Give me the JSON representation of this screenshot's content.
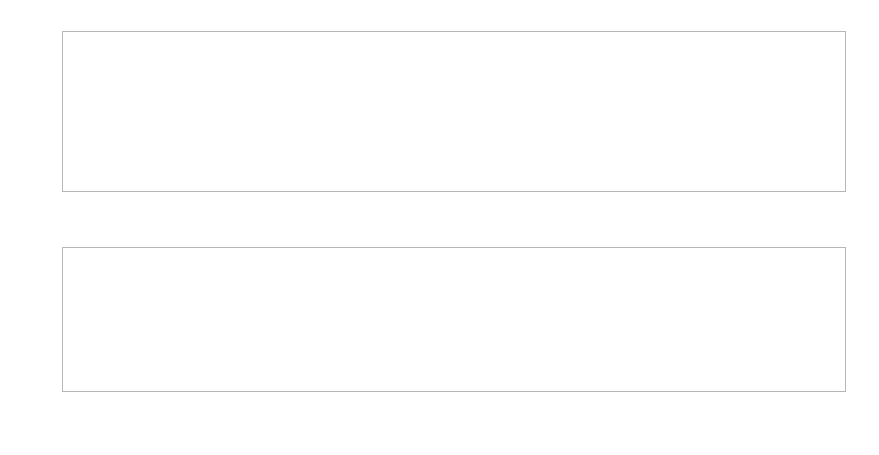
{
  "figure": {
    "width": 879,
    "height": 455,
    "background": "#ffffff",
    "line_color": "#808080",
    "axis_color": "#b6b6b6",
    "tick_color": "#3c3c3c",
    "marker_color": "#1a1a1a"
  },
  "chart_data": [
    {
      "type": "line",
      "id": "top-panel",
      "title": "",
      "xlabel": "",
      "ylabel": "",
      "grid": false,
      "legend": "none",
      "ylim": [
        172.6,
        203.0
      ],
      "yticks": [
        175,
        180,
        185,
        190,
        195,
        200
      ],
      "ytick_labels": [
        "175",
        "180",
        "185",
        "190",
        "195",
        "200"
      ],
      "categories": [
        "1A",
        "2G",
        "3C",
        "4C",
        "5A",
        "6G",
        "7G",
        "8G",
        "9C",
        "10T",
        "11C",
        "12A",
        "13A",
        "14G",
        "15T",
        "16A",
        "17C",
        "18A",
        "19A"
      ],
      "values": [
        201.6,
        201.6,
        201.6,
        199.8,
        199.8,
        199.8,
        199.8,
        198.0,
        198.0,
        198.0,
        197.3,
        197.3,
        181.3,
        179.0,
        175.7,
        174.8,
        174.7,
        173.8,
        173.6
      ],
      "vertical_markers": [
        "1A",
        "19A"
      ],
      "marker_points": [
        "1A",
        "19A"
      ]
    },
    {
      "type": "line",
      "id": "bottom-panel",
      "title": "",
      "xlabel": "",
      "ylabel": "",
      "grid": false,
      "legend": "none",
      "ylim": [
        991.5,
        1013.2
      ],
      "yticks": [
        995,
        1000,
        1005,
        1010
      ],
      "ytick_labels": [
        "995",
        "1000",
        "1005",
        "1010"
      ],
      "categories": [
        "516G",
        "517C",
        "518T",
        "519G",
        "520G",
        "521A",
        "522G",
        "523A",
        "524T",
        "525G",
        "526A",
        "527T",
        "528C",
        "529C",
        "530T",
        "531C",
        "532A",
        "533A",
        "534C",
        "535A",
        "536A",
        "537G",
        "538C",
        "539C",
        "540A",
        "541G",
        "542G",
        "543G",
        "544C",
        "545T",
        "546C",
        "547A",
        "548A",
        "549G",
        "550T",
        "551A",
        "552C",
        "553A",
        "554A",
        "555G",
        "556C",
        "557C",
        "558T",
        "559G",
        "560T",
        "561C",
        "562T",
        "563G",
        "564C",
        "565A",
        "566A",
        "567C",
        "568C",
        "569A",
        "570G",
        "571G",
        "572T",
        "573G",
        "574G"
      ],
      "values": [
        1012.6,
        1011.9,
        1011.6,
        1011.1,
        1010.6,
        1010.1,
        1009.9,
        1009.1,
        1008.9,
        1008.0,
        1008.0,
        1008.0,
        1008.0,
        1010.1,
        1010.1,
        1010.1,
        1010.1,
        1010.1,
        1009.2,
        1008.1,
        1008.1,
        1008.1,
        1008.1,
        1008.1,
        1008.1,
        1008.1,
        1008.1,
        1007.1,
        1007.1,
        1006.6,
        1006.6,
        1006.0,
        1005.8,
        1005.3,
        1005.3,
        1005.1,
        1004.4,
        999.9,
        991.9,
        991.9,
        991.9,
        991.9,
        991.9,
        991.9,
        991.9,
        991.9,
        992.6,
        992.6,
        992.6,
        992.6,
        992.6,
        991.9,
        991.9,
        991.9,
        991.9,
        991.9,
        991.9,
        991.9,
        991.9
      ],
      "vertical_markers": [
        "536A",
        "554A"
      ],
      "marker_points": [
        "536A",
        "554A"
      ]
    }
  ]
}
